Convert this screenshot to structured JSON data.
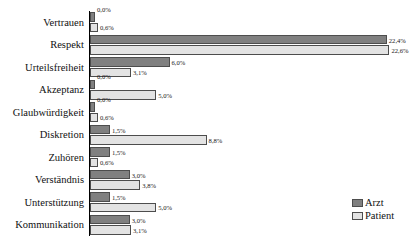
{
  "chart_data": {
    "type": "bar",
    "orientation": "horizontal",
    "title": "",
    "subtitle": "",
    "xlabel": "",
    "ylabel": "",
    "xlim": [
      0,
      24
    ],
    "grid": false,
    "legend_position": "bottom-right",
    "value_suffix": "%",
    "categories": [
      "Vertrauen",
      "Respekt",
      "Urteilsfreiheit",
      "Akzeptanz",
      "Glaubwürdigkeit",
      "Diskretion",
      "Zuhören",
      "Verständnis",
      "Unterstützung",
      "Kommunikation"
    ],
    "series": [
      {
        "name": "Arzt",
        "color": "#808080",
        "values": [
          0.0,
          22.4,
          6.0,
          0.0,
          0.0,
          1.5,
          1.5,
          3.0,
          1.5,
          3.0
        ],
        "labels": [
          "0,0%",
          "22,4%",
          "6,0%",
          "0,0%",
          "0,0%",
          "1,5%",
          "1,5%",
          "3,0%",
          "1,5%",
          "3,0%"
        ]
      },
      {
        "name": "Patient",
        "color": "#e3e3e3",
        "values": [
          0.6,
          22.6,
          3.1,
          5.0,
          0.6,
          8.8,
          0.6,
          3.8,
          5.0,
          3.1
        ],
        "labels": [
          "0,6%",
          "22,6%",
          "3,1%",
          "5,0%",
          "0,6%",
          "8,8%",
          "0,6%",
          "3,8%",
          "5,0%",
          "3,1%"
        ]
      }
    ],
    "legend": [
      {
        "label": "Arzt",
        "color": "#808080"
      },
      {
        "label": "Patient",
        "color": "#e3e3e3"
      }
    ]
  }
}
